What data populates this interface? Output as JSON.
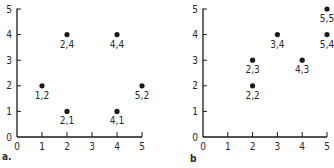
{
  "chart_data": [
    {
      "type": "scatter",
      "panel_label": "a.",
      "title": "",
      "xlabel": "",
      "ylabel": "",
      "xlim": [
        0,
        5
      ],
      "ylim": [
        0,
        5
      ],
      "x_ticks": [
        "0",
        "1",
        "2",
        "3",
        "4",
        "5"
      ],
      "y_ticks": [
        "0",
        "1",
        "2",
        "3",
        "4",
        "5"
      ],
      "grid": false,
      "points": [
        {
          "x": 1,
          "y": 2,
          "label": "1,2"
        },
        {
          "x": 2,
          "y": 4,
          "label": "2,4"
        },
        {
          "x": 2,
          "y": 1,
          "label": "2,1"
        },
        {
          "x": 4,
          "y": 4,
          "label": "4,4"
        },
        {
          "x": 4,
          "y": 1,
          "label": "4,1"
        },
        {
          "x": 5,
          "y": 2,
          "label": "5,2"
        }
      ]
    },
    {
      "type": "scatter",
      "panel_label": "b",
      "title": "",
      "xlabel": "",
      "ylabel": "",
      "xlim": [
        0,
        5
      ],
      "ylim": [
        0,
        5
      ],
      "x_ticks": [
        "0",
        "1",
        "2",
        "3",
        "4",
        "5"
      ],
      "y_ticks": [
        "0",
        "1",
        "2",
        "3",
        "4",
        "5"
      ],
      "grid": false,
      "points": [
        {
          "x": 2,
          "y": 3,
          "label": "2,3"
        },
        {
          "x": 2,
          "y": 2,
          "label": "2,2"
        },
        {
          "x": 3,
          "y": 4,
          "label": "3,4"
        },
        {
          "x": 4,
          "y": 3,
          "label": "4,3"
        },
        {
          "x": 5,
          "y": 5,
          "label": "5,5"
        },
        {
          "x": 5,
          "y": 4,
          "label": "5,4"
        }
      ]
    }
  ],
  "style": {
    "ink": "#1a1a1a",
    "background": "#ffffff"
  }
}
